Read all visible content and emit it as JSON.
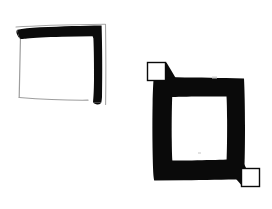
{
  "image": {
    "width": 272,
    "height": 209,
    "background_color": "#ffffff",
    "description": "Two hand-drawn black-and-white geometric figures on a plain white background",
    "ink_color": "#0a0a0a",
    "faint_line_color": "#9a9a9a"
  },
  "figures": [
    {
      "id": "left-figure",
      "name": "open-square-bracket-figure",
      "label": "Square outline with thick black top and right edges",
      "bbox": {
        "x": 14,
        "y": 24,
        "width": 92,
        "height": 80
      },
      "strokes": [
        {
          "name": "thick-top-edge",
          "weight": "thick",
          "color": "#0a0a0a"
        },
        {
          "name": "thick-right-edge",
          "weight": "thick",
          "color": "#0a0a0a"
        },
        {
          "name": "thin-left-edge",
          "weight": "thin",
          "color": "#9a9a9a"
        },
        {
          "name": "thin-bottom-edge",
          "weight": "thin",
          "color": "#9a9a9a"
        },
        {
          "name": "thin-outer-top-line",
          "weight": "thin",
          "color": "#9a9a9a"
        },
        {
          "name": "thin-outer-right-line",
          "weight": "thin",
          "color": "#9a9a9a"
        }
      ]
    },
    {
      "id": "right-figure",
      "name": "thick-square-ring-figure",
      "label": "Thick black square ring with small white square tabs at top-left and bottom-right corners",
      "bbox": {
        "x": 146,
        "y": 60,
        "width": 114,
        "height": 128
      },
      "ring": {
        "outer": {
          "x": 152,
          "y": 77,
          "width": 93,
          "height": 103
        },
        "inner": {
          "x": 172,
          "y": 96,
          "width": 55,
          "height": 64
        },
        "fill": "#0a0a0a",
        "hole_fill": "#ffffff"
      },
      "tabs": [
        {
          "name": "top-left-white-square-tab",
          "position": "top-left",
          "x": 146,
          "y": 62,
          "width": 20,
          "height": 20,
          "fill": "#ffffff",
          "stroke": "#0a0a0a"
        },
        {
          "name": "bottom-right-white-square-tab",
          "position": "bottom-right",
          "x": 240,
          "y": 168,
          "width": 20,
          "height": 20,
          "fill": "#ffffff",
          "stroke": "#0a0a0a"
        }
      ],
      "connectors": [
        {
          "name": "top-left-diagonal-connector",
          "from": "top-left-white-square-tab",
          "to": "ring-outer-corner"
        },
        {
          "name": "bottom-right-diagonal-connector",
          "from": "bottom-right-white-square-tab",
          "to": "ring-outer-corner"
        }
      ]
    }
  ]
}
